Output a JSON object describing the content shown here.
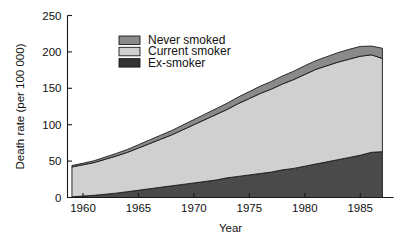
{
  "chart_data": {
    "type": "area",
    "title": "",
    "subtitle": "",
    "xlabel": "Year",
    "ylabel": "Death rate (per 100 000)",
    "xlim": [
      1958.6,
      1988.0
    ],
    "ylim": [
      0,
      250
    ],
    "xticks": [
      1960,
      1965,
      1970,
      1975,
      1980,
      1985
    ],
    "yticks": [
      0,
      50,
      100,
      150,
      200,
      250
    ],
    "xtick_labels": [
      "1960",
      "1965",
      "1970",
      "1975",
      "1980",
      "1985"
    ],
    "ytick_labels": [
      "0",
      "50",
      "100",
      "150",
      "200",
      "250"
    ],
    "grid": false,
    "stacked": true,
    "stack_order_bottom_to_top": [
      "Ex-smoker",
      "Current smoker",
      "Never smoked"
    ],
    "legend_position": "upper-left-inside",
    "x": [
      1959,
      1960,
      1961,
      1962,
      1963,
      1964,
      1965,
      1966,
      1967,
      1968,
      1969,
      1970,
      1971,
      1972,
      1973,
      1974,
      1975,
      1976,
      1977,
      1978,
      1979,
      1980,
      1981,
      1982,
      1983,
      1984,
      1985,
      1986,
      1987
    ],
    "series": [
      {
        "name": "Ex-smoker",
        "color": "#4a4a4a",
        "values": [
          1,
          2,
          3,
          4.5,
          6,
          8,
          10,
          12,
          14,
          16,
          18,
          20,
          22,
          24,
          27,
          29,
          31,
          33,
          35,
          38,
          40,
          43,
          46,
          49,
          52,
          55,
          58,
          62,
          63
        ]
      },
      {
        "name": "Current smoker",
        "color": "#d0d0d0",
        "values": [
          41,
          43,
          45,
          48,
          51,
          54,
          58,
          62,
          66,
          70,
          75,
          80,
          85,
          90,
          94,
          100,
          105,
          110,
          114,
          118,
          122,
          126,
          130,
          132,
          134,
          135,
          136,
          134,
          128
        ]
      },
      {
        "name": "Never smoked",
        "color": "#8a8a8a",
        "values": [
          2,
          2,
          2.5,
          3,
          3.5,
          4,
          4.5,
          5,
          5.5,
          6,
          6.5,
          7,
          7.5,
          8,
          8.5,
          9,
          9.5,
          10,
          10.5,
          11,
          11.5,
          12,
          12,
          12.5,
          13,
          13.5,
          13.5,
          12,
          14
        ]
      }
    ],
    "cumulative_top_values": [
      44,
      47,
      50.5,
      55.5,
      60.5,
      66,
      72.5,
      79,
      85.5,
      92,
      99.5,
      107,
      114.5,
      122,
      129.5,
      138,
      145.5,
      153,
      159.5,
      167,
      173.5,
      181,
      188,
      193.5,
      199,
      203.5,
      207.5,
      208,
      205
    ],
    "annotations": []
  },
  "legend": {
    "items": [
      {
        "label": "Never smoked",
        "color": "#8a8a8a"
      },
      {
        "label": "Current smoker",
        "color": "#d0d0d0"
      },
      {
        "label": "Ex-smoker",
        "color": "#323232"
      }
    ]
  },
  "colors": {
    "never_smoked": "#8a8a8a",
    "current_smoker": "#d0d0d0",
    "ex_smoker": "#4a4a4a",
    "ex_smoker_legend": "#323232",
    "axis": "#1a1a1a",
    "background": "#ffffff"
  }
}
